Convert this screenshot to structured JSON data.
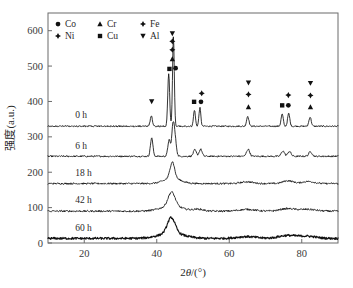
{
  "chart_data": {
    "type": "line",
    "title": "",
    "xlabel": "2θ/(°)",
    "ylabel": "强度(a.u.)",
    "xlim": [
      10,
      90
    ],
    "ylim": [
      0,
      650
    ],
    "xticks": [
      20,
      40,
      60,
      80
    ],
    "yticks": [
      0,
      100,
      200,
      300,
      400,
      500,
      600
    ],
    "grid": false,
    "legend_position": "top-left",
    "legend": [
      {
        "label": "Co",
        "marker": "circle"
      },
      {
        "label": "Cr",
        "marker": "triangle-up"
      },
      {
        "label": "Fe",
        "marker": "star"
      },
      {
        "label": "Ni",
        "marker": "star"
      },
      {
        "label": "Cu",
        "marker": "square"
      },
      {
        "label": "Al",
        "marker": "triangle-down"
      }
    ],
    "series": [
      {
        "name": "0 h",
        "label": "0 h",
        "offset": 330,
        "label_x": 17.5,
        "label_y": 352,
        "noise": 2.0,
        "peaks": [
          {
            "x": 38.5,
            "h": 30,
            "w": 0.3
          },
          {
            "x": 43.3,
            "h": 150,
            "w": 0.26
          },
          {
            "x": 44.6,
            "h": 255,
            "w": 0.24
          },
          {
            "x": 50.4,
            "h": 46,
            "w": 0.26
          },
          {
            "x": 51.9,
            "h": 52,
            "w": 0.26
          },
          {
            "x": 65.1,
            "h": 28,
            "w": 0.32
          },
          {
            "x": 74.6,
            "h": 34,
            "w": 0.3
          },
          {
            "x": 76.4,
            "h": 36,
            "w": 0.3
          },
          {
            "x": 82.3,
            "h": 26,
            "w": 0.32
          }
        ]
      },
      {
        "name": "6 h",
        "label": "6 h",
        "offset": 245,
        "label_x": 17.5,
        "label_y": 267,
        "noise": 2.2,
        "peaks": [
          {
            "x": 38.6,
            "h": 52,
            "w": 0.34
          },
          {
            "x": 43.4,
            "h": 46,
            "w": 0.34
          },
          {
            "x": 44.5,
            "h": 88,
            "w": 0.36
          },
          {
            "x": 45.1,
            "h": 40,
            "w": 0.36
          },
          {
            "x": 50.5,
            "h": 18,
            "w": 0.4
          },
          {
            "x": 52.1,
            "h": 20,
            "w": 0.4
          },
          {
            "x": 65.2,
            "h": 20,
            "w": 0.44
          },
          {
            "x": 74.8,
            "h": 15,
            "w": 0.44
          },
          {
            "x": 76.6,
            "h": 14,
            "w": 0.44
          },
          {
            "x": 82.4,
            "h": 13,
            "w": 0.46
          }
        ]
      },
      {
        "name": "18 h",
        "label": "18 h",
        "offset": 168,
        "label_x": 17.5,
        "label_y": 190,
        "noise": 2.4,
        "peaks": [
          {
            "x": 44.3,
            "h": 46,
            "w": 0.6
          },
          {
            "x": 44.3,
            "h": 16,
            "w": 2.2
          },
          {
            "x": 64.9,
            "h": 5,
            "w": 1.6
          },
          {
            "x": 76.2,
            "h": 8,
            "w": 1.4
          },
          {
            "x": 81.8,
            "h": 6,
            "w": 1.6
          }
        ]
      },
      {
        "name": "42 h",
        "label": "42 h",
        "offset": 90,
        "label_x": 17.5,
        "label_y": 112,
        "noise": 2.6,
        "peaks": [
          {
            "x": 44.1,
            "h": 40,
            "w": 0.95
          },
          {
            "x": 44.1,
            "h": 14,
            "w": 3.0
          },
          {
            "x": 51.5,
            "h": 5,
            "w": 1.4
          },
          {
            "x": 64.8,
            "h": 5,
            "w": 2.2
          },
          {
            "x": 76.0,
            "h": 7,
            "w": 2.0
          },
          {
            "x": 81.6,
            "h": 5,
            "w": 2.2
          }
        ]
      },
      {
        "name": "60 h",
        "label": "60 h",
        "offset": 13,
        "label_x": 17.5,
        "label_y": 35,
        "noise": 3.0,
        "bold": true,
        "peaks": [
          {
            "x": 44.0,
            "h": 44,
            "w": 1.05
          },
          {
            "x": 44.0,
            "h": 15,
            "w": 3.4
          },
          {
            "x": 64.8,
            "h": 5,
            "w": 2.6
          },
          {
            "x": 76.0,
            "h": 8,
            "w": 2.4
          },
          {
            "x": 81.5,
            "h": 6,
            "w": 2.4
          }
        ]
      }
    ],
    "peak_markers": [
      {
        "x": 38.6,
        "y": 400,
        "marker": "triangle-down",
        "phase": "Al"
      },
      {
        "x": 44.3,
        "y": 592,
        "marker": "triangle-down",
        "phase": "Al"
      },
      {
        "x": 44.3,
        "y": 570,
        "marker": "star",
        "phase": "Ni"
      },
      {
        "x": 44.3,
        "y": 546,
        "marker": "star",
        "phase": "Fe"
      },
      {
        "x": 44.3,
        "y": 520,
        "marker": "triangle-up",
        "phase": "Cr"
      },
      {
        "x": 43.5,
        "y": 492,
        "marker": "square",
        "phase": "Cu"
      },
      {
        "x": 45.2,
        "y": 494,
        "marker": "circle",
        "phase": "Co"
      },
      {
        "x": 52.4,
        "y": 423,
        "marker": "star",
        "phase": "Ni"
      },
      {
        "x": 50.3,
        "y": 399,
        "marker": "square",
        "phase": "Cu"
      },
      {
        "x": 52.2,
        "y": 399,
        "marker": "circle",
        "phase": "Co"
      },
      {
        "x": 65.3,
        "y": 453,
        "marker": "triangle-down",
        "phase": "Al"
      },
      {
        "x": 65.3,
        "y": 420,
        "marker": "star",
        "phase": "Ni"
      },
      {
        "x": 65.3,
        "y": 384,
        "marker": "triangle-up",
        "phase": "Cr"
      },
      {
        "x": 76.3,
        "y": 418,
        "marker": "star",
        "phase": "Ni"
      },
      {
        "x": 74.6,
        "y": 389,
        "marker": "square",
        "phase": "Cu"
      },
      {
        "x": 76.3,
        "y": 389,
        "marker": "circle",
        "phase": "Co"
      },
      {
        "x": 82.4,
        "y": 452,
        "marker": "triangle-down",
        "phase": "Al"
      },
      {
        "x": 82.4,
        "y": 417,
        "marker": "star",
        "phase": "Ni"
      },
      {
        "x": 82.4,
        "y": 384,
        "marker": "triangle-up",
        "phase": "Cr"
      }
    ]
  }
}
